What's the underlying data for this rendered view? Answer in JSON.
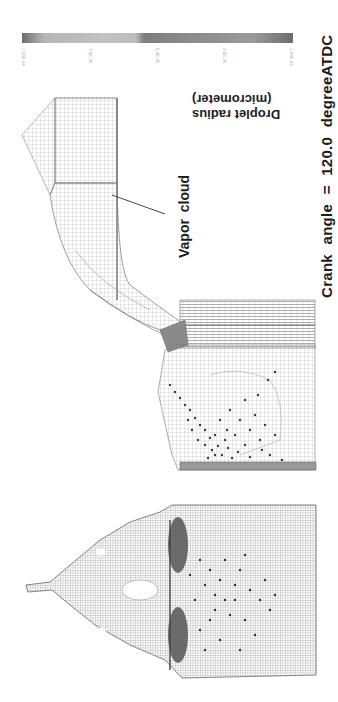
{
  "figure": {
    "caption": "Crank angle = 120.0 degreeATDC",
    "annotation": "Vapor cloud",
    "legend": {
      "title_line1": "Droplet radius",
      "title_line2": "(micrometer)",
      "ticks": [
        "1.00E-04",
        "7.5E-05",
        "5.0E-05",
        "2.5E-05",
        "1.00E-06"
      ]
    },
    "panels": [
      {
        "name": "intake-port-mesh",
        "description": "Intake port computational mesh with vapor cloud"
      },
      {
        "name": "cylinder-spray",
        "description": "Cylinder side view with fuel droplets"
      },
      {
        "name": "cylinder-head-view",
        "description": "Cylinder head/top view with valves and droplets"
      }
    ],
    "colors": {
      "mesh": "#8a8a8a",
      "droplet": "#3a3a3a",
      "text": "#1c1c1c"
    }
  }
}
